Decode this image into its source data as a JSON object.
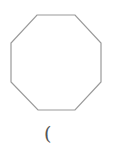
{
  "shape": {
    "type": "octagon",
    "stroke": "#9a9a9a",
    "fill": "#ffffff",
    "points": "37,15 75,15 101,43 101,82 75,110 38,110 11,82 11,43"
  },
  "label": {
    "text": "("
  }
}
